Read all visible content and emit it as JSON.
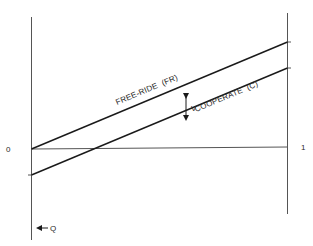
{
  "diagram": {
    "axes": {
      "left_label": "0",
      "right_label": "1",
      "q_label": "Q"
    },
    "lines": {
      "upper": {
        "label": "FREE-RIDE  (FR)"
      },
      "lower": {
        "label": "COOPERATE  (C)"
      }
    },
    "gap_label": "V",
    "colors": {
      "line": "#1a1a1a",
      "axis": "#555555",
      "text": "#2a2a2a"
    }
  }
}
